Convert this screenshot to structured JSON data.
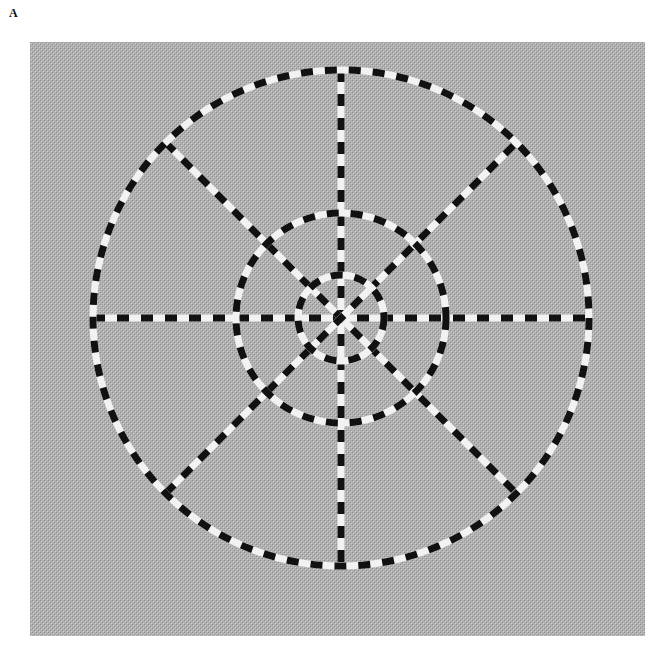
{
  "figure": {
    "panel_label": "A",
    "canvas": {
      "width": 659,
      "height": 649
    },
    "background": {
      "x": 30,
      "y": 42,
      "width": 615,
      "height": 594,
      "color": "#a9a9a9",
      "texture_color_a": "#9a9a9a",
      "texture_color_b": "#c4c4c4"
    },
    "center": {
      "x": 341,
      "y": 318
    },
    "stroke": {
      "width": 7,
      "dash": 12,
      "gap": 12,
      "color_a": "#111111",
      "color_b": "#f2f2f2"
    },
    "circles": [
      {
        "name": "outer",
        "r": 248
      },
      {
        "name": "middle",
        "r": 105
      },
      {
        "name": "inner",
        "r": 43
      }
    ],
    "spokes": [
      {
        "name": "vertical",
        "angle_deg": 90
      },
      {
        "name": "horizontal",
        "angle_deg": 0
      },
      {
        "name": "diagonal-down",
        "angle_deg": 45
      },
      {
        "name": "diagonal-up",
        "angle_deg": -45
      }
    ]
  }
}
